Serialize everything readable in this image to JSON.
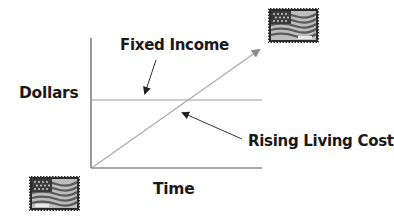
{
  "diagram": {
    "labels": {
      "fixed_income": "Fixed Income",
      "dollars": "Dollars",
      "rising_living_cost": "Rising Living Cost",
      "time": "Time"
    },
    "axes": {
      "x_label": "Time",
      "y_label": "Dollars"
    },
    "lines": [
      {
        "name": "Fixed Income",
        "shape": "horizontal",
        "color": "#9a9a9a"
      },
      {
        "name": "Rising Living Cost",
        "shape": "diagonal-rising-arrow",
        "color": "#a8a8a8"
      }
    ],
    "icons": {
      "top_right": "flag-stamp-icon",
      "bottom_left": "flag-stamp-icon"
    },
    "colors": {
      "text": "#1a1a1a",
      "axis": "#555555",
      "arrow": "#333333",
      "line": "#9a9a9a"
    }
  }
}
